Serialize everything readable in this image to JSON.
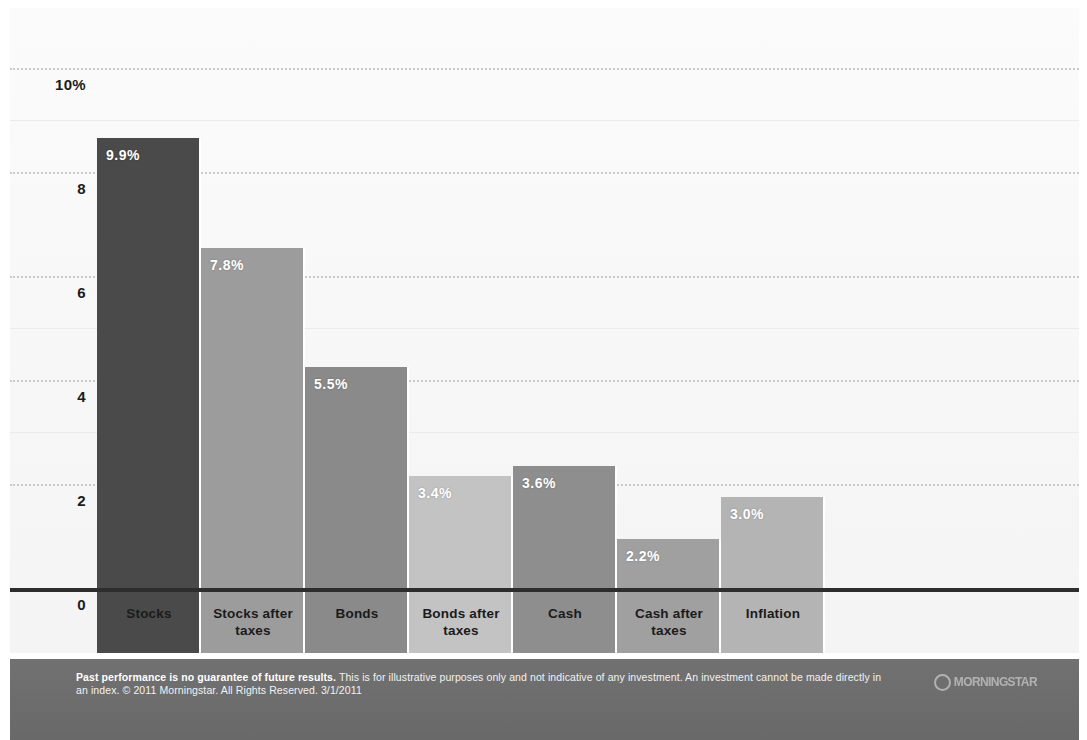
{
  "chart_data": {
    "type": "bar",
    "title": "",
    "subtitle": "",
    "xlabel": "",
    "ylabel": "",
    "categories": [
      "Stocks",
      "Stocks after taxes",
      "Bonds",
      "Bonds after taxes",
      "Cash",
      "Cash after taxes",
      "Inflation"
    ],
    "values": [
      9.9,
      7.8,
      5.5,
      3.4,
      3.6,
      2.2,
      3.0
    ],
    "value_labels": [
      "9.9%",
      "7.8%",
      "5.5%",
      "3.4%",
      "3.6%",
      "2.2%",
      "3.0%"
    ],
    "bar_colors": [
      "#4a4a4a",
      "#9c9c9c",
      "#8a8a8a",
      "#c3c3c3",
      "#8e8e8e",
      "#a0a0a0",
      "#b4b4b4"
    ],
    "ylim": [
      0,
      10.6
    ],
    "yticks": [
      0,
      2,
      4,
      6,
      8,
      10
    ],
    "ytick_labels": [
      "0",
      "2",
      "4",
      "6",
      "8",
      "10%"
    ],
    "grid": true,
    "grid_style": "dotted horizontal",
    "legend": "none",
    "value_label_position": "inside-top-left",
    "value_label_color": "#ffffff"
  },
  "axis": {
    "y_ticks": [
      {
        "label": "10%",
        "value": 10
      },
      {
        "label": "8",
        "value": 8
      },
      {
        "label": "6",
        "value": 6
      },
      {
        "label": "4",
        "value": 4
      },
      {
        "label": "2",
        "value": 2
      },
      {
        "label": "0",
        "value": 0
      }
    ]
  },
  "categories": [
    {
      "line1": "Stocks",
      "line2": ""
    },
    {
      "line1": "Stocks after",
      "line2": "taxes"
    },
    {
      "line1": "Bonds",
      "line2": ""
    },
    {
      "line1": "Bonds after",
      "line2": "taxes"
    },
    {
      "line1": "Cash",
      "line2": ""
    },
    {
      "line1": "Cash after",
      "line2": "taxes"
    },
    {
      "line1": "Inflation",
      "line2": ""
    }
  ],
  "footer": {
    "disclaimer_bold": "Past performance is no guarantee of future results.",
    "disclaimer_rest": " This is for illustrative purposes only and not indicative of any investment. An investment cannot be made directly in an index. © 2011 Morningstar. All Rights Reserved. 3/1/2011",
    "logo_word": "MORNINGSTAR",
    "background_color": "#6e6e6e"
  }
}
